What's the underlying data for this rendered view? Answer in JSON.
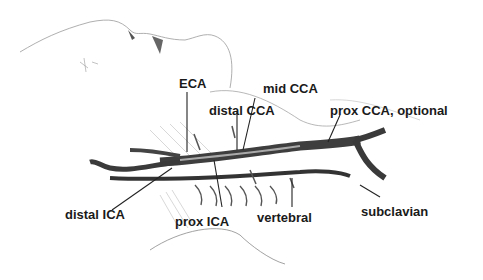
{
  "diagram": {
    "labels": {
      "eca": "ECA",
      "mid_cca": "mid CCA",
      "distal_cca": "distal CCA",
      "prox_cca": "prox CCA, optional",
      "distal_ica": "distal ICA",
      "prox_ica": "prox ICA",
      "vertebral": "vertebral",
      "subclavian": "subclavian"
    },
    "colors": {
      "ink": "#1a1a1a",
      "vessel": "#4a4a4a",
      "sketch": "#8a8a8a",
      "background": "#ffffff"
    }
  }
}
